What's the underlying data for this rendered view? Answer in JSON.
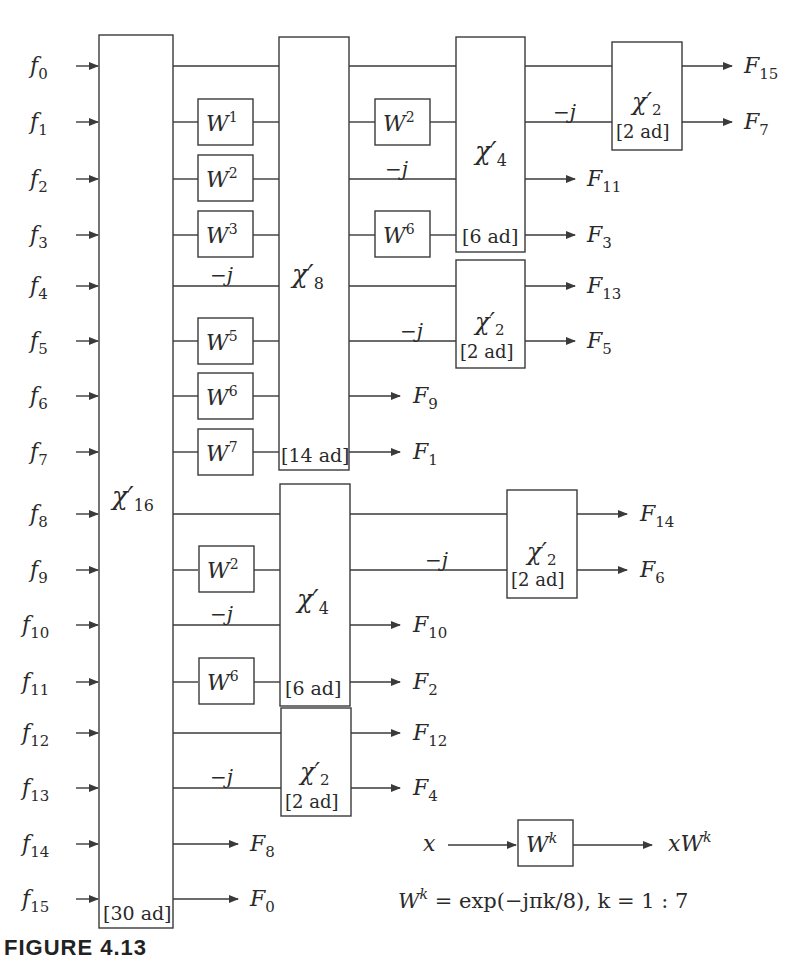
{
  "diagram": {
    "inputs": [
      "f0",
      "f1",
      "f2",
      "f3",
      "f4",
      "f5",
      "f6",
      "f7",
      "f8",
      "f9",
      "f10",
      "f11",
      "f12",
      "f13",
      "f14",
      "f15"
    ],
    "blocks": [
      {
        "id": "chi16",
        "label": "χ′16",
        "base": "χ",
        "sub": "16",
        "cost": "[30 ad]"
      },
      {
        "id": "chi8",
        "label": "χ′8",
        "base": "χ",
        "sub": "8",
        "cost": "[14 ad]"
      },
      {
        "id": "chi4_upper",
        "label": "χ′4",
        "base": "χ",
        "sub": "4",
        "cost": "[6 ad]"
      },
      {
        "id": "chi4_lower",
        "label": "χ′4",
        "base": "χ",
        "sub": "4",
        "cost": "[6 ad]"
      },
      {
        "id": "chi2_top",
        "label": "χ′2",
        "base": "χ",
        "sub": "2",
        "cost": "[2 ad]"
      },
      {
        "id": "chi2_mid",
        "label": "χ′2",
        "base": "χ",
        "sub": "2",
        "cost": "[2 ad]"
      },
      {
        "id": "chi2_right",
        "label": "χ′2",
        "base": "χ",
        "sub": "2",
        "cost": "[2 ad]"
      },
      {
        "id": "chi2_bottom",
        "label": "χ′2",
        "base": "χ",
        "sub": "2",
        "cost": "[2 ad]"
      }
    ],
    "twiddles_stage1": [
      {
        "row": 1,
        "exp": "1"
      },
      {
        "row": 2,
        "exp": "2"
      },
      {
        "row": 3,
        "exp": "3"
      },
      {
        "row": 5,
        "exp": "5"
      },
      {
        "row": 6,
        "exp": "6"
      },
      {
        "row": 7,
        "exp": "7"
      },
      {
        "row": 9,
        "exp": "2"
      },
      {
        "row": 11,
        "exp": "6"
      }
    ],
    "twiddles_stage2": [
      {
        "row": 1,
        "exp": "2"
      },
      {
        "row": 3,
        "exp": "6"
      }
    ],
    "minus_j_label": "−j",
    "twiddle_base": "W",
    "outputs": {
      "F15": "F15",
      "F7": "F7",
      "F11": "F11",
      "F3": "F3",
      "F13": "F13",
      "F5": "F5",
      "F9": "F9",
      "F1": "F1",
      "F14": "F14",
      "F6": "F6",
      "F10": "F10",
      "F2": "F2",
      "F12": "F12",
      "F4": "F4",
      "F8": "F8",
      "F0": "F0"
    },
    "output_labels": [
      {
        "base": "F",
        "sub": "15"
      },
      {
        "base": "F",
        "sub": "7"
      },
      {
        "base": "F",
        "sub": "11"
      },
      {
        "base": "F",
        "sub": "3"
      },
      {
        "base": "F",
        "sub": "13"
      },
      {
        "base": "F",
        "sub": "5"
      },
      {
        "base": "F",
        "sub": "9"
      },
      {
        "base": "F",
        "sub": "1"
      },
      {
        "base": "F",
        "sub": "14"
      },
      {
        "base": "F",
        "sub": "6"
      },
      {
        "base": "F",
        "sub": "10"
      },
      {
        "base": "F",
        "sub": "2"
      },
      {
        "base": "F",
        "sub": "12"
      },
      {
        "base": "F",
        "sub": "4"
      },
      {
        "base": "F",
        "sub": "8"
      },
      {
        "base": "F",
        "sub": "0"
      }
    ],
    "legend": {
      "input": "x",
      "box_base": "W",
      "box_sup": "k",
      "output_base": "xW",
      "output_sup": "k",
      "formula_lhs_base": "W",
      "formula_lhs_sup": "k",
      "formula_rhs": " = exp(−jπk/8), k = 1 : 7"
    }
  },
  "caption": "FIGURE 4.13"
}
